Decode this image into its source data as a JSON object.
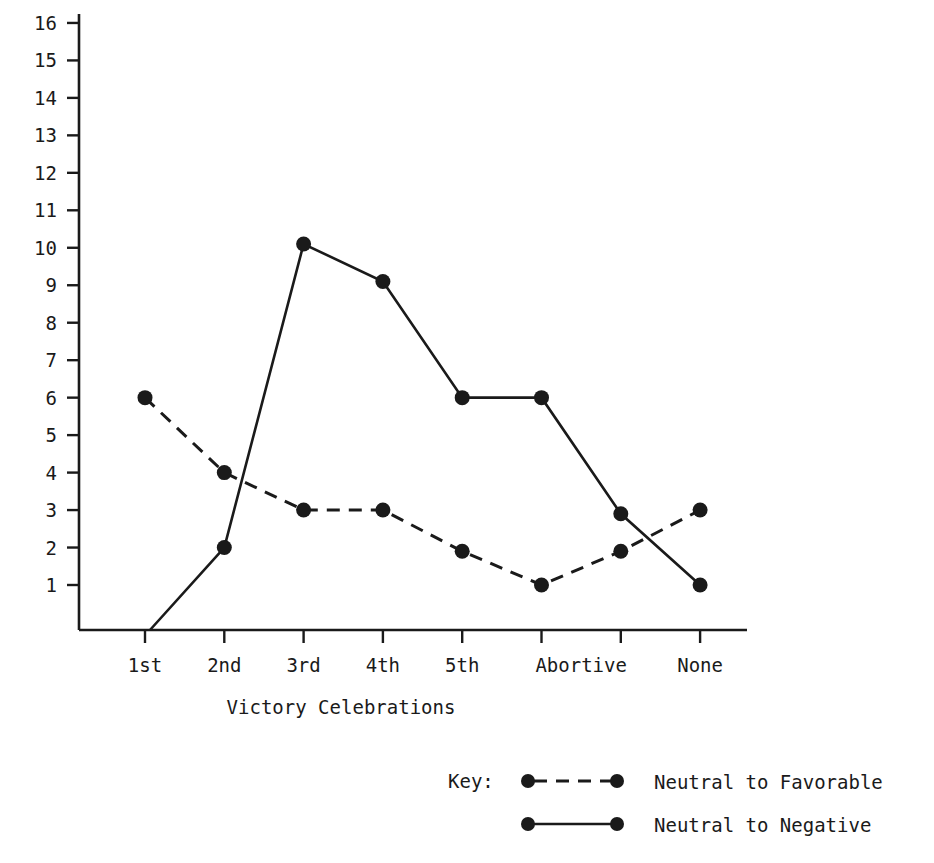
{
  "chart_data": {
    "type": "line",
    "title": "",
    "xlabel": "Victory Celebrations",
    "ylabel": "",
    "categories": [
      "1st",
      "2nd",
      "3rd",
      "4th",
      "5th",
      "Abortive",
      "None"
    ],
    "ytick_labels": [
      "16",
      "15",
      "14",
      "13",
      "12",
      "11",
      "10",
      "9",
      "8",
      "7",
      "6",
      "5",
      "4",
      "3",
      "2",
      "1"
    ],
    "yticks": [
      16,
      15,
      14,
      13,
      12,
      11,
      10,
      9,
      8,
      7,
      6,
      5,
      4,
      3,
      2,
      1
    ],
    "ylim": [
      0,
      16.4
    ],
    "grid": false,
    "legend_position": "bottom-right",
    "legend_key_label": "Key:",
    "series": [
      {
        "name": "Neutral to Favorable",
        "style": "dashed",
        "marker": "circle",
        "values": [
          6,
          4,
          3,
          3,
          1.9,
          1,
          3
        ],
        "points_x": [
          "1st",
          "2nd",
          "3rd",
          "4th",
          "5th",
          "Abortive",
          "None"
        ]
      },
      {
        "name": "Neutral to Negative",
        "style": "solid",
        "marker": "circle",
        "values": [
          0,
          2,
          10.1,
          9.1,
          6,
          6,
          1
        ],
        "points_x": [
          "1st",
          "2nd",
          "3rd",
          "4th",
          "5th",
          "Abortive",
          "None"
        ],
        "note_first_point_unmarked": true
      }
    ],
    "extra_solid_vertex": {
      "label": "between Abortive and None",
      "value": 2.9
    },
    "extra_dashed_vertex": {
      "label": "between Abortive and None",
      "value": 1.9
    },
    "colors": {
      "ink": "#1a1a1a",
      "background": "#ffffff"
    }
  },
  "axis": {
    "x_tick_count": 8,
    "x_label_text": "Victory Celebrations"
  },
  "legend": {
    "key": "Key:",
    "entries": [
      {
        "label": "Neutral to Favorable",
        "style": "dashed"
      },
      {
        "label": "Neutral to Negative",
        "style": "solid"
      }
    ]
  }
}
